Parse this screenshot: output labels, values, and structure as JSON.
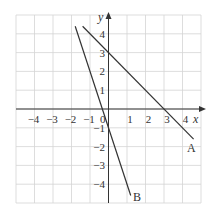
{
  "chart_data": {
    "type": "line",
    "title": "",
    "xlabel": "x",
    "ylabel": "y",
    "xlim": [
      -5,
      5
    ],
    "ylim": [
      -5,
      5
    ],
    "grid": true,
    "x_ticks": [
      -4,
      -3,
      -2,
      -1,
      1,
      2,
      3,
      4
    ],
    "y_ticks": [
      4,
      3,
      2,
      1,
      -1,
      -2,
      -3,
      -4
    ],
    "origin_label": "0",
    "series": [
      {
        "name": "A",
        "equation": "y = 3 - x",
        "x": [
          -1.4,
          4.6
        ],
        "y": [
          4.4,
          -1.6
        ]
      },
      {
        "name": "B",
        "equation": "y = -3x - 1",
        "x": [
          -1.8,
          1.2
        ],
        "y": [
          4.4,
          -4.6
        ]
      }
    ]
  },
  "labels": {
    "x_axis": "x",
    "y_axis": "y",
    "origin": "0",
    "line_a": "A",
    "line_b": "B"
  }
}
